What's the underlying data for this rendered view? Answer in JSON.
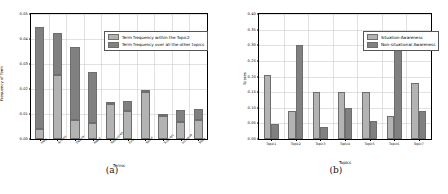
{
  "figure": {
    "panels": [
      {
        "caption": "(a)",
        "colors": {
          "light": "#b3b3b3",
          "dark": "#808080"
        },
        "chart_data": {
          "type": "bar",
          "subtype": "stacked",
          "title": "",
          "xlabel": "Terms",
          "ylabel": "Frequency of Term",
          "ylim": [
            0.0,
            0.05
          ],
          "yticks": [
            "0.00",
            "0.01",
            "0.02",
            "0.03",
            "0.04",
            "0.05"
          ],
          "ytick_values": [
            0.0,
            0.01,
            0.02,
            0.03,
            0.04,
            0.05
          ],
          "grid": true,
          "legend_position": "upper right",
          "categories": [
            "Help",
            "Access",
            "Details",
            "Need",
            "Resources",
            "Find",
            "Relief",
            "Support",
            "Increase",
            "Work"
          ],
          "series": [
            {
              "name": "Term frequency within the Topic2",
              "color": "#b3b3b3",
              "values": [
                0.004,
                0.0256,
                0.0078,
                0.0063,
                0.014,
                0.0113,
                0.019,
                0.0091,
                0.007,
                0.0077
              ]
            },
            {
              "name": "Term frequency over all the other topics",
              "color": "#808080",
              "values": [
                0.041,
                0.017,
                0.029,
                0.0205,
                0.0003,
                0.004,
                0.0,
                0.0005,
                0.0047,
                0.0042
              ]
            }
          ],
          "totals": [
            0.045,
            0.0426,
            0.0368,
            0.0268,
            0.0143,
            0.0153,
            0.019,
            0.0096,
            0.0117,
            0.0119
          ]
        }
      },
      {
        "caption": "(b)",
        "colors": {
          "light": "#b3b3b3",
          "dark": "#808080"
        },
        "chart_data": {
          "type": "bar",
          "subtype": "grouped",
          "title": "",
          "xlabel": "Topics",
          "ylabel": "Scores",
          "ylim": [
            0.0,
            0.4
          ],
          "yticks": [
            "0.00",
            "0.05",
            "0.10",
            "0.15",
            "0.20",
            "0.25",
            "0.30",
            "0.35",
            "0.40"
          ],
          "ytick_values": [
            0.0,
            0.05,
            0.1,
            0.15,
            0.2,
            0.25,
            0.3,
            0.35,
            0.4
          ],
          "grid": true,
          "legend_position": "upper right",
          "categories": [
            "Topic1",
            "Topic2",
            "Topic3",
            "Topic4",
            "Topic5",
            "Topic6",
            "Topic7"
          ],
          "series": [
            {
              "name": "Situation-Awareness",
              "color": "#b3b3b3",
              "values": [
                0.204,
                0.089,
                0.149,
                0.149,
                0.149,
                0.074,
                0.179
              ]
            },
            {
              "name": "Non-situational Awareness",
              "color": "#808080",
              "values": [
                0.048,
                0.3,
                0.04,
                0.099,
                0.058,
                0.329,
                0.089
              ]
            }
          ]
        }
      }
    ]
  }
}
